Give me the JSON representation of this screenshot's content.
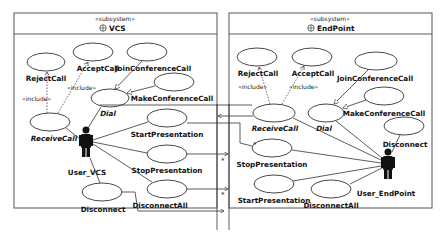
{
  "diagram": {
    "type": "UML use case diagram",
    "subsystems": [
      {
        "id": "vcs",
        "stereotype": "«subsystem»",
        "name": "VCS",
        "icon": "subsystem-icon",
        "actor": "User_VCS",
        "use_cases": [
          {
            "name": "RejectCall",
            "italic": false
          },
          {
            "name": "AcceptCall",
            "italic": false
          },
          {
            "name": "JoinConferenceCall",
            "italic": false
          },
          {
            "name": "MakeConferenceCall",
            "italic": false
          },
          {
            "name": "Dial",
            "italic": true
          },
          {
            "name": "ReceiveCall",
            "italic": true
          },
          {
            "name": "StartPresentation",
            "italic": false
          },
          {
            "name": "StopPresentation",
            "italic": false
          },
          {
            "name": "DisconnectAll",
            "italic": false
          },
          {
            "name": "Disconnect",
            "italic": false
          }
        ],
        "include_labels": [
          "«include»",
          "«include»"
        ]
      },
      {
        "id": "endpoint",
        "stereotype": "«subsystem»",
        "name": "EndPoint",
        "icon": "subsystem-icon",
        "actor": "User_EndPoint",
        "use_cases": [
          {
            "name": "RejectCall",
            "italic": false
          },
          {
            "name": "AcceptCall",
            "italic": false
          },
          {
            "name": "JoinConferenceCall",
            "italic": false
          },
          {
            "name": "MakeConferenceCall",
            "italic": false
          },
          {
            "name": "ReceiveCall",
            "italic": true
          },
          {
            "name": "Dial",
            "italic": true
          },
          {
            "name": "Disconnect",
            "italic": false
          },
          {
            "name": "StopPresentation",
            "italic": false
          },
          {
            "name": "StartPresentation",
            "italic": false
          },
          {
            "name": "DisconnectAll",
            "italic": false
          }
        ],
        "include_labels": [
          "«include»",
          "«include»"
        ]
      }
    ],
    "multiplicities": [
      "*",
      "*",
      "*"
    ]
  }
}
